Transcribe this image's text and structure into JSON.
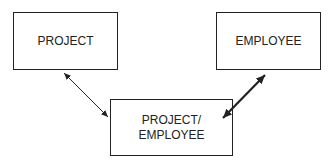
{
  "diagram": {
    "type": "entity-relationship",
    "entities": [
      {
        "id": "project",
        "label": "PROJECT"
      },
      {
        "id": "employee",
        "label": "EMPLOYEE"
      },
      {
        "id": "project_employee",
        "label_line1": "PROJECT/",
        "label_line2": "EMPLOYEE"
      }
    ],
    "relationships": [
      {
        "from": "project",
        "to": "project_employee",
        "style": "thin",
        "direction": "bidirectional"
      },
      {
        "from": "employee",
        "to": "project_employee",
        "style": "thick",
        "direction": "bidirectional"
      }
    ],
    "colors": {
      "stroke": "#222222",
      "background": "#ffffff"
    }
  }
}
